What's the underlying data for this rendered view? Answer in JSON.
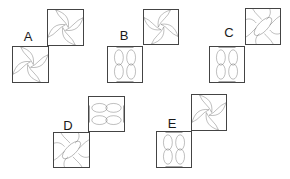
{
  "question": {
    "type": "odd-one-out / figure matching",
    "options": [
      {
        "label": "A",
        "label_pos": [
          28,
          36
        ],
        "tiles": [
          {
            "position": "top-right",
            "box": [
              47,
              9,
              37,
              37
            ],
            "pattern": "pinwheel",
            "rotation": 0
          },
          {
            "position": "bottom-left",
            "box": [
              12,
              46,
              37,
              37
            ],
            "pattern": "pinwheel",
            "rotation": 0
          }
        ]
      },
      {
        "label": "B",
        "label_pos": [
          124,
          35
        ],
        "tiles": [
          {
            "position": "top-right",
            "box": [
              143,
              9,
              36,
              36
            ],
            "pattern": "pinwheel-reverse",
            "rotation": 0
          },
          {
            "position": "bottom-left",
            "box": [
              107,
              46,
              36,
              37
            ],
            "pattern": "double-lens-vertical",
            "rotation": 0
          }
        ]
      },
      {
        "label": "C",
        "label_pos": [
          229,
          32
        ],
        "tiles": [
          {
            "position": "top-right",
            "box": [
              245,
              8,
              36,
              37
            ],
            "pattern": "pinwheel-with-diagonal-ellipse",
            "rotation": 0
          },
          {
            "position": "bottom-left",
            "box": [
              209,
              46,
              36,
              37
            ],
            "pattern": "double-lens-vertical",
            "rotation": 0
          }
        ]
      },
      {
        "label": "D",
        "label_pos": [
          68,
          125
        ],
        "tiles": [
          {
            "position": "top-right",
            "box": [
              88,
              96,
              37,
              36
            ],
            "pattern": "double-lens-horizontal",
            "rotation": 0
          },
          {
            "position": "bottom-left",
            "box": [
              53,
              132,
              37,
              36
            ],
            "pattern": "pinwheel-with-diagonal-ellipse",
            "rotation": 0
          }
        ]
      },
      {
        "label": "E",
        "label_pos": [
          172,
          123
        ],
        "tiles": [
          {
            "position": "top-right",
            "box": [
              191,
              94,
              36,
              37
            ],
            "pattern": "pinwheel",
            "rotation": 0
          },
          {
            "position": "bottom-left",
            "box": [
              156,
              131,
              36,
              37
            ],
            "pattern": "double-lens-vertical",
            "rotation": 0
          }
        ]
      }
    ]
  },
  "colors": {
    "stroke": "#555555",
    "border": "#444444",
    "label": "#1a1a1a",
    "background": "#ffffff"
  }
}
